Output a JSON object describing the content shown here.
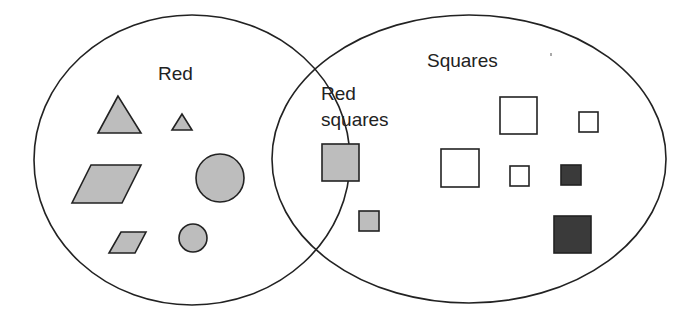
{
  "diagram": {
    "type": "venn",
    "colors": {
      "outline": "#222222",
      "red_fill": "#bdbdbd",
      "empty_fill": "#ffffff",
      "dark_fill": "#3a3a3a",
      "background": "#ffffff"
    },
    "sets": [
      {
        "id": "red",
        "label": "Red",
        "cx": 192,
        "cy": 160,
        "rx": 158,
        "ry": 145
      },
      {
        "id": "squares",
        "label": "Squares",
        "cx": 469,
        "cy": 159,
        "rx": 197,
        "ry": 144
      }
    ],
    "intersection": {
      "label_line1": "Red",
      "label_line2": "squares"
    },
    "shapes": {
      "red_only": [
        {
          "kind": "triangle",
          "size": "large"
        },
        {
          "kind": "triangle",
          "size": "small"
        },
        {
          "kind": "parallelogram",
          "size": "large"
        },
        {
          "kind": "circle",
          "size": "large"
        },
        {
          "kind": "parallelogram",
          "size": "small"
        },
        {
          "kind": "circle",
          "size": "small"
        }
      ],
      "intersection": [
        {
          "kind": "square",
          "fill": "red",
          "size": "large"
        },
        {
          "kind": "square",
          "fill": "red",
          "size": "small"
        }
      ],
      "squares_only": [
        {
          "kind": "square",
          "fill": "empty",
          "size": "large"
        },
        {
          "kind": "square",
          "fill": "empty",
          "size": "small"
        },
        {
          "kind": "square",
          "fill": "empty",
          "size": "large"
        },
        {
          "kind": "square",
          "fill": "empty",
          "size": "small"
        },
        {
          "kind": "square",
          "fill": "dark",
          "size": "small"
        },
        {
          "kind": "square",
          "fill": "dark",
          "size": "large"
        }
      ]
    }
  }
}
